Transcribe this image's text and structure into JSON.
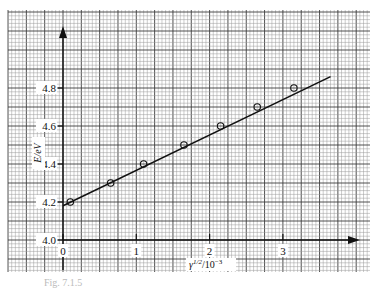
{
  "chart_data": {
    "type": "scatter",
    "title": "",
    "xlabel": "γ^1/2 / 10^-3",
    "ylabel": "E/eV",
    "xlim": [
      -0.75,
      4.2
    ],
    "ylim": [
      3.83,
      5.11
    ],
    "x_ticks": [
      0,
      1,
      2,
      3
    ],
    "y_ticks": [
      4.0,
      4.2,
      4.4,
      4.6,
      4.8
    ],
    "grid": true,
    "legend": null,
    "series": [
      {
        "name": "measured",
        "marker": "circle-open",
        "x": [
          0.1,
          0.65,
          1.1,
          1.65,
          2.15,
          2.65,
          3.15
        ],
        "y": [
          4.2,
          4.3,
          4.4,
          4.5,
          4.6,
          4.7,
          4.8
        ]
      },
      {
        "name": "fit",
        "style": "line",
        "x": [
          0.0,
          3.65
        ],
        "y": [
          4.18,
          4.86
        ]
      }
    ]
  },
  "labels": {
    "ylabel": "E/eV",
    "xlabel_base": "γ",
    "xlabel_sup": "1/2",
    "xlabel_rest": "/10",
    "xlabel_exp": "−3",
    "caption": "Fig. 7.1.5"
  },
  "colors": {
    "paper": "#ffffff",
    "fine_grid": "#9a9a9a",
    "major_grid": "#3c3c3c",
    "ink": "#111111"
  }
}
